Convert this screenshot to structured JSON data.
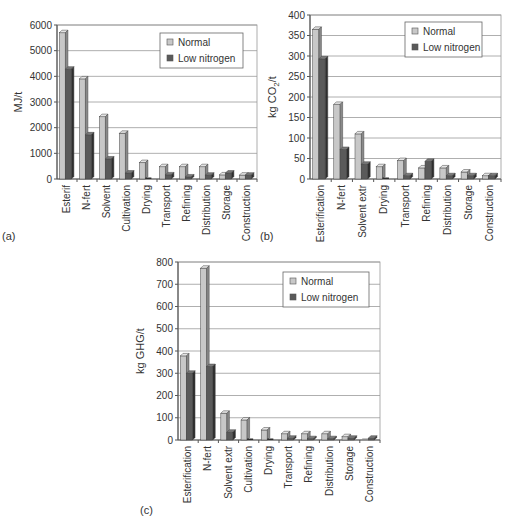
{
  "colors": {
    "normal": "#c8c8c8",
    "normal_top": "#e4e4e4",
    "normal_side": "#8a8a8a",
    "low": "#5a5a5a",
    "low_top": "#7a7a7a",
    "low_side": "#2e2e2e",
    "grid": "#9a9a9a",
    "axis": "#555555",
    "text": "#333333"
  },
  "chart_data": [
    {
      "panel": "(a)",
      "type": "bar",
      "title": "",
      "xlabel": "",
      "ylabel": "MJ/t",
      "ylim": [
        0,
        6000
      ],
      "yticks": [
        0,
        1000,
        2000,
        3000,
        4000,
        5000,
        6000
      ],
      "grid": true,
      "legend_position": "upper right",
      "categories": [
        "Esterif",
        "N-fert",
        "Solvent",
        "Cultivation",
        "Drying",
        "Transport",
        "Refining",
        "Distribution",
        "Storage",
        "Construction"
      ],
      "series": [
        {
          "name": "Normal",
          "values": [
            5700,
            3900,
            2430,
            1780,
            640,
            480,
            480,
            480,
            160,
            150
          ]
        },
        {
          "name": "Low nitrogen",
          "values": [
            4280,
            1720,
            780,
            230,
            0,
            160,
            80,
            150,
            230,
            150
          ]
        }
      ]
    },
    {
      "panel": "(b)",
      "type": "bar",
      "title": "",
      "xlabel": "",
      "ylabel": "kg CO2/t",
      "ylim": [
        0,
        400
      ],
      "yticks": [
        0,
        50,
        100,
        150,
        200,
        250,
        300,
        350,
        400
      ],
      "grid": true,
      "legend_position": "upper right",
      "categories": [
        "Esterification",
        "N-fert",
        "Solvent extr",
        "Drying",
        "Transport",
        "Refining",
        "Distribution",
        "Storage",
        "Construction"
      ],
      "series": [
        {
          "name": "Normal",
          "values": [
            365,
            182,
            110,
            30,
            45,
            27,
            27,
            17,
            8
          ]
        },
        {
          "name": "Low nitrogen",
          "values": [
            293,
            72,
            36,
            0,
            8,
            43,
            8,
            8,
            8
          ]
        }
      ]
    },
    {
      "panel": "(c)",
      "type": "bar",
      "title": "",
      "xlabel": "",
      "ylabel": "kg GHG/t",
      "ylim": [
        0,
        800
      ],
      "yticks": [
        0,
        100,
        200,
        300,
        400,
        500,
        600,
        700,
        800
      ],
      "grid": true,
      "legend_position": "upper right",
      "categories": [
        "Esterification",
        "N-fert",
        "Solvent extr",
        "Cultivation",
        "Drying",
        "Transport",
        "Refining",
        "Distribution",
        "Storage",
        "Construction"
      ],
      "series": [
        {
          "name": "Normal",
          "values": [
            378,
            772,
            120,
            90,
            45,
            28,
            28,
            28,
            15,
            0
          ]
        },
        {
          "name": "Low nitrogen",
          "values": [
            300,
            330,
            35,
            0,
            0,
            8,
            6,
            6,
            8,
            8
          ]
        }
      ]
    }
  ]
}
